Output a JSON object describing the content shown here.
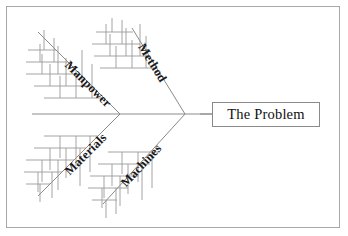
{
  "diagram": {
    "type": "fishbone-ishikawa",
    "title": "",
    "effect": {
      "label": "The Problem",
      "box": {
        "x": 212,
        "y": 102,
        "w": 108,
        "h": 25
      }
    },
    "spine": {
      "y": 114,
      "x_start": 32,
      "x_end": 212,
      "color": "#8a8a8a"
    },
    "vertices": [
      {
        "name": "upper-left-junction",
        "x": 120,
        "y": 114
      },
      {
        "name": "right-junction",
        "x": 185,
        "y": 114
      }
    ],
    "categories": [
      {
        "id": "manpower",
        "label": "Manpower",
        "position": "upper-left",
        "bone": {
          "x1": 120,
          "y1": 114,
          "x2": 38,
          "y2": 32
        },
        "label_angle": 45,
        "label_x": 72,
        "label_y": 58,
        "rib_count": 5
      },
      {
        "id": "method",
        "label": "Method",
        "position": "upper-right",
        "bone": {
          "x1": 185,
          "y1": 114,
          "x2": 132,
          "y2": 28
        },
        "label_angle": 58,
        "label_x": 150,
        "label_y": 43,
        "rib_count": 4
      },
      {
        "id": "materials",
        "label": "Materials",
        "position": "lower-left",
        "bone": {
          "x1": 120,
          "y1": 114,
          "x2": 38,
          "y2": 196
        },
        "label_angle": -45,
        "label_x": 64,
        "label_y": 168,
        "rib_count": 5
      },
      {
        "id": "machines",
        "label": "Machines",
        "position": "lower-right",
        "bone": {
          "x1": 185,
          "y1": 114,
          "x2": 103,
          "y2": 204
        },
        "label_angle": -47,
        "label_x": 120,
        "label_y": 178,
        "rib_count": 5
      }
    ],
    "colors": {
      "line": "#8a8a8a",
      "rib": "#9a9a9a",
      "text": "#1a1a1a",
      "border": "#a8a8a8",
      "background": "#ffffff"
    }
  }
}
